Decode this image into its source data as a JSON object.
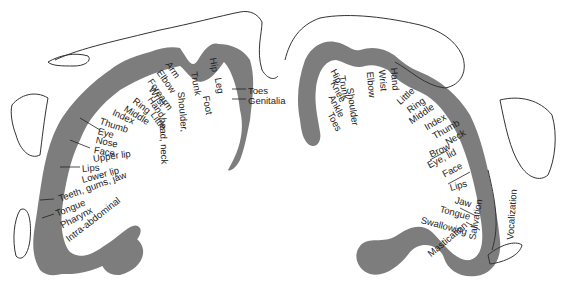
{
  "colors": {
    "cortex": "#7d7d7d",
    "ink": "#222222",
    "background": "#ffffff"
  },
  "sensory": {
    "labels": [
      {
        "text": "Toes",
        "x": 248,
        "y": 91,
        "rot": 0
      },
      {
        "text": "Genitalia",
        "x": 248,
        "y": 101,
        "rot": 0
      },
      {
        "text": "Hip",
        "x": 213,
        "y": 58,
        "rot": 80
      },
      {
        "text": "Leg",
        "x": 218,
        "y": 78,
        "rot": 80
      },
      {
        "text": "Foot",
        "x": 206,
        "y": 96,
        "rot": 80
      },
      {
        "text": "Trunk",
        "x": 194,
        "y": 72,
        "rot": 80
      },
      {
        "text": "Shoulder,",
        "x": 181,
        "y": 92,
        "rot": 85
      },
      {
        "text": "head, neck",
        "x": 163,
        "y": 118,
        "rot": 88
      },
      {
        "text": "Arm",
        "x": 168,
        "y": 63,
        "rot": 55
      },
      {
        "text": "Elbow",
        "x": 159,
        "y": 71,
        "rot": 55
      },
      {
        "text": "Forearm",
        "x": 150,
        "y": 80,
        "rot": 55
      },
      {
        "text": "Wrist",
        "x": 151,
        "y": 88,
        "rot": 55
      },
      {
        "text": "Hand",
        "x": 150,
        "y": 98,
        "rot": 55
      },
      {
        "text": "Little",
        "x": 153,
        "y": 113,
        "rot": 55
      },
      {
        "text": "Ring",
        "x": 134,
        "y": 100,
        "rot": 38
      },
      {
        "text": "Middle",
        "x": 125,
        "y": 108,
        "rot": 32
      },
      {
        "text": "Index",
        "x": 113,
        "y": 112,
        "rot": 25
      },
      {
        "text": "Thumb",
        "x": 100,
        "y": 121,
        "rot": 18
      },
      {
        "text": "Eye",
        "x": 98,
        "y": 131,
        "rot": 15
      },
      {
        "text": "Nose",
        "x": 96,
        "y": 140,
        "rot": 12
      },
      {
        "text": "Face",
        "x": 94,
        "y": 150,
        "rot": 10
      },
      {
        "text": "Upper lip",
        "x": 93,
        "y": 159,
        "rot": -8
      },
      {
        "text": "Lips",
        "x": 82,
        "y": 169,
        "rot": -5
      },
      {
        "text": "Lower lip",
        "x": 82,
        "y": 180,
        "rot": -15
      },
      {
        "text": "Teeth, gums, jaw",
        "x": 59,
        "y": 199,
        "rot": -20
      },
      {
        "text": "Tongue",
        "x": 56,
        "y": 214,
        "rot": -22
      },
      {
        "text": "Pharynx",
        "x": 61,
        "y": 226,
        "rot": -28
      },
      {
        "text": "Intra-abdominal",
        "x": 67,
        "y": 240,
        "rot": -38
      }
    ]
  },
  "motor": {
    "labels": [
      {
        "text": "Hip",
        "x": 333,
        "y": 70,
        "rot": 62
      },
      {
        "text": "Knee",
        "x": 333,
        "y": 82,
        "rot": 62
      },
      {
        "text": "Ankle",
        "x": 331,
        "y": 96,
        "rot": 62
      },
      {
        "text": "Toes",
        "x": 330,
        "y": 113,
        "rot": 62
      },
      {
        "text": "Trunk",
        "x": 342,
        "y": 76,
        "rot": 80
      },
      {
        "text": "Shoulder",
        "x": 350,
        "y": 88,
        "rot": 82
      },
      {
        "text": "Elbow",
        "x": 370,
        "y": 72,
        "rot": 85
      },
      {
        "text": "Wrist",
        "x": 382,
        "y": 70,
        "rot": 85
      },
      {
        "text": "Hand",
        "x": 394,
        "y": 68,
        "rot": 85
      },
      {
        "text": "Little",
        "x": 398,
        "y": 103,
        "rot": -42
      },
      {
        "text": "Ring",
        "x": 408,
        "y": 111,
        "rot": -35
      },
      {
        "text": "Middle",
        "x": 410,
        "y": 122,
        "rot": -35
      },
      {
        "text": "Index",
        "x": 425,
        "y": 128,
        "rot": -30
      },
      {
        "text": "Thumb",
        "x": 433,
        "y": 137,
        "rot": -30
      },
      {
        "text": "Neck",
        "x": 446,
        "y": 143,
        "rot": -30
      },
      {
        "text": "Brow",
        "x": 430,
        "y": 155,
        "rot": -25
      },
      {
        "text": "Eye, lid",
        "x": 428,
        "y": 166,
        "rot": -28
      },
      {
        "text": "Face",
        "x": 443,
        "y": 175,
        "rot": -28
      },
      {
        "text": "Lips",
        "x": 450,
        "y": 188,
        "rot": -15
      },
      {
        "text": "Jaw",
        "x": 455,
        "y": 200,
        "rot": 15
      },
      {
        "text": "Tongue",
        "x": 440,
        "y": 209,
        "rot": 15
      },
      {
        "text": "Swallowing",
        "x": 421,
        "y": 220,
        "rot": 15
      },
      {
        "text": "Salivation",
        "x": 472,
        "y": 240,
        "rot": -80
      },
      {
        "text": "Mastication",
        "x": 429,
        "y": 255,
        "rot": -40
      },
      {
        "text": "Vocalization",
        "x": 510,
        "y": 240,
        "rot": -86
      }
    ]
  }
}
